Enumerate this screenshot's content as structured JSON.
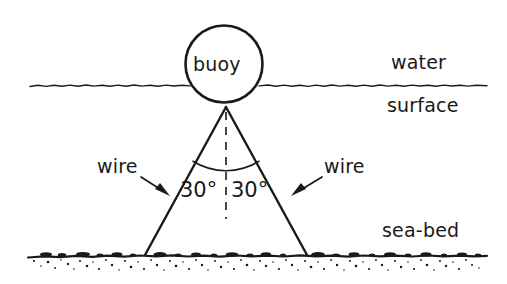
{
  "figure": {
    "type": "physics-force-diagram",
    "background_color": "#ffffff",
    "ink_color": "#1a1a1a"
  },
  "labels": {
    "buoy": "buoy",
    "water": "water",
    "surface": "surface",
    "sea_bed": "sea-bed",
    "wire_left": "wire",
    "wire_right": "wire",
    "angle_left": "30°",
    "angle_right": "30°"
  },
  "geometry": {
    "buoy_circle": {
      "cx": 224,
      "cy": 64,
      "r": 38
    },
    "apex": {
      "x": 226,
      "y": 107
    },
    "wire_left_end": {
      "x": 145,
      "y": 255
    },
    "wire_right_end": {
      "x": 307,
      "y": 255
    },
    "water_line_y": 85,
    "water_line_x_start": 30,
    "water_line_x_end": 487,
    "sea_bed_line_y": 256,
    "sea_bed_x_start": 28,
    "sea_bed_x_end": 487,
    "dashed_vertical_x": 226,
    "dashed_vertical_y_start": 112,
    "dashed_vertical_y_end": 218,
    "angle_arc_radius": 62
  },
  "annotations": {
    "angle_between_wire_and_vertical_deg": 30,
    "total_angle_between_wires_deg": 60
  }
}
